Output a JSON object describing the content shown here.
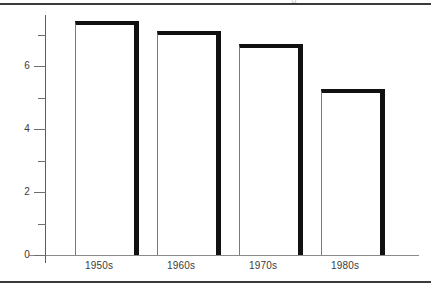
{
  "figure": {
    "clipped_glyph": "g",
    "rules": {
      "top": "horizontal-rule",
      "bottom": "horizontal-rule"
    }
  },
  "chart_data": {
    "type": "bar",
    "title": "",
    "subtitle": "",
    "xlabel": "",
    "ylabel": "",
    "categories": [
      "1950s",
      "1960s",
      "1970s",
      "1980s"
    ],
    "values": [
      7.43,
      7.1,
      6.7,
      5.27
    ],
    "ylim": [
      0,
      7.9
    ],
    "xlim": [
      0,
      4
    ],
    "grid": false,
    "legend": null,
    "y_major_ticks": [
      0,
      2,
      4,
      6
    ],
    "y_major_tick_labels": [
      "0",
      "2",
      "4",
      "6"
    ],
    "y_minor_ticks": [
      1,
      3,
      5,
      7
    ],
    "bar_style": {
      "face_color": "#ffffff",
      "edge_color": "#111111",
      "shadow": "right-and-top-heavy-edge"
    },
    "axis_color": "#5d5d5d",
    "text_color": "#3a3a3a"
  }
}
